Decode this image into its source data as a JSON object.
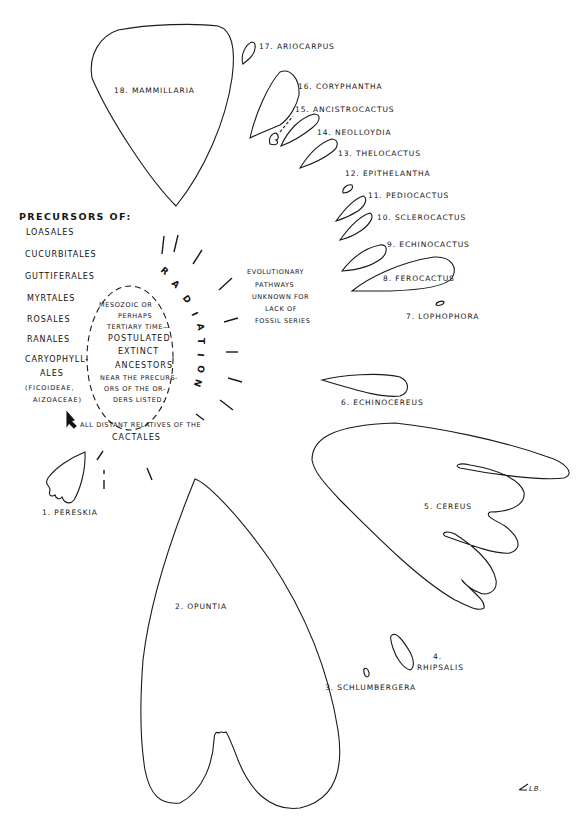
{
  "precursors": {
    "title": "PRECURSORS OF:",
    "orders": [
      "LOASALES",
      "CUCURBITALES",
      "GUTTIFERALES",
      "MYRTALES",
      "ROSALES",
      "RANALES",
      "CARYOPHYLL-",
      "ALES",
      "(FICOIDEAE,",
      "AIZOACEAE)"
    ]
  },
  "ancestors": {
    "lines": [
      "MESOZOIC OR",
      "PERHAPS",
      "TERTIARY TIME—",
      "POSTULATED",
      "EXTINCT",
      "ANCESTORS",
      "NEAR THE PRECURS-",
      "ORS OF THE OR-",
      "DERS LISTED."
    ]
  },
  "radiation_letters": [
    "R",
    "A",
    "D",
    "I",
    "A",
    "T",
    "I",
    "O",
    "N"
  ],
  "evolutionary_note": [
    "EVOLUTIONARY",
    "PATHWAYS",
    "UNKNOWN FOR",
    "LACK OF",
    "FOSSIL SERIES"
  ],
  "relatives_note": [
    "ALL DISTANT RELATIVES OF THE",
    "CACTALES"
  ],
  "genera": {
    "g1": "1. PERESKIA",
    "g2": "2. OPUNTIA",
    "g3": "3. SCHLUMBERGERA",
    "g4_num": "4.",
    "g4": "RHIPSALIS",
    "g5": "5. CEREUS",
    "g6": "6. ECHINOCEREUS",
    "g7": "7.  LOPHOPHORA",
    "g8": "8. FEROCACTUS",
    "g9": "9. ECHINOCACTUS",
    "g10": "10. SCLEROCACTUS",
    "g11": "11. PEDIOCACTUS",
    "g12": "12. EPITHELANTHA",
    "g13": "13. THELOCACTUS",
    "g14": "14. NEOLLOYDIA",
    "g15": "15. ANCISTROCACTUS",
    "g16": "16. CORYPHANTHA",
    "g17": "17. ARIOCARPUS",
    "g18": "18. MAMMILLARIA"
  },
  "signature": "LB."
}
